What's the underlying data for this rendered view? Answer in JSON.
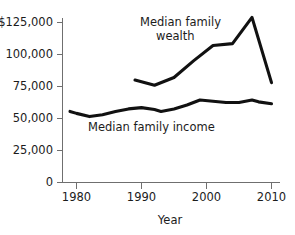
{
  "chart_data": {
    "type": "line",
    "title": "",
    "xlabel": "Year",
    "ylabel": "",
    "xlim": [
      1978,
      2011
    ],
    "ylim": [
      0,
      131000
    ],
    "grid": false,
    "legend_position": "inline-annotations",
    "x_tick_labels": [
      "1980",
      "1990",
      "2000",
      "2010"
    ],
    "x_tick_values": [
      1980,
      1990,
      2000,
      2010
    ],
    "y_tick_labels": [
      "$125,000",
      "100,000",
      "75,000",
      "50,000",
      "25,000",
      "0"
    ],
    "y_tick_values": [
      125000,
      100000,
      75000,
      50000,
      25000,
      0
    ],
    "series": [
      {
        "name": "Median family wealth",
        "label_line1": "Median family",
        "label_line2": "wealth",
        "color": "#111111",
        "x": [
          1989,
          1992,
          1995,
          1998,
          2001,
          2004,
          2007,
          2010
        ],
        "values": [
          80000,
          76000,
          82000,
          95000,
          107000,
          108500,
          129000,
          78000
        ]
      },
      {
        "name": "Median family income",
        "label_line1": "Median family income",
        "label_line2": "",
        "color": "#111111",
        "x": [
          1979,
          1980,
          1982,
          1984,
          1986,
          1988,
          1990,
          1992,
          1993,
          1995,
          1997,
          1999,
          2001,
          2003,
          2005,
          2007,
          2008,
          2010
        ],
        "values": [
          55500,
          54000,
          51500,
          53000,
          55500,
          57500,
          58500,
          57000,
          55500,
          57500,
          60500,
          64500,
          63500,
          62500,
          62500,
          64500,
          63000,
          61500
        ]
      }
    ],
    "annotations": [
      {
        "text": "Median family",
        "x_px": 140,
        "y_px": 26
      },
      {
        "text": "wealth",
        "x_px": 155,
        "y_px": 40
      },
      {
        "text": "Median family income",
        "x_px": 88,
        "y_px": 131
      }
    ]
  },
  "axis": {
    "x_title": "Year"
  }
}
